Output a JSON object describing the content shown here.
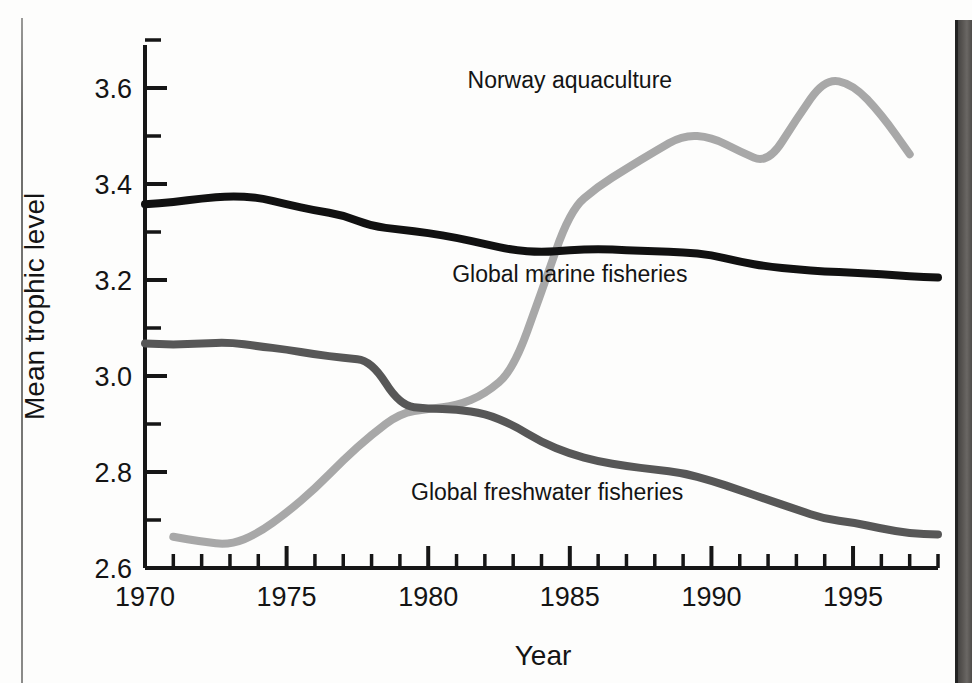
{
  "chart_data": {
    "type": "line",
    "title": "",
    "xlabel": "Year",
    "ylabel": "Mean trophic level",
    "xlim": [
      1970,
      1998
    ],
    "ylim": [
      2.6,
      3.7
    ],
    "x_ticks": [
      1970,
      1975,
      1980,
      1985,
      1990,
      1995
    ],
    "x_tick_labels": [
      "1970",
      "1975",
      "1980",
      "1985",
      "1990",
      "1995"
    ],
    "x_minor_step": 1,
    "y_ticks": [
      2.6,
      2.8,
      3.0,
      3.2,
      3.4,
      3.6
    ],
    "y_tick_labels": [
      "2.6",
      "2.8",
      "3.0",
      "3.2",
      "3.4",
      "3.6"
    ],
    "y_minor_step": 0.1,
    "grid": false,
    "legend": "inline-annotations",
    "series": [
      {
        "name": "Norway aquaculture",
        "color": "#a8a8a8",
        "label_x": 1985.0,
        "label_y": 3.6,
        "x": [
          1971,
          1972,
          1973,
          1974,
          1975,
          1976,
          1977,
          1978,
          1979,
          1980,
          1981,
          1982,
          1983,
          1984,
          1985,
          1986,
          1987,
          1988,
          1989,
          1990,
          1991,
          1992,
          1993,
          1994,
          1995,
          1996,
          1997
        ],
        "y": [
          2.665,
          2.655,
          2.648,
          2.672,
          2.715,
          2.765,
          2.825,
          2.878,
          2.922,
          2.932,
          2.938,
          2.962,
          3.012,
          3.175,
          3.345,
          3.395,
          3.432,
          3.468,
          3.502,
          3.498,
          3.468,
          3.442,
          3.535,
          3.62,
          3.608,
          3.545,
          3.462
        ]
      },
      {
        "name": "Global marine fisheries",
        "color": "#111111",
        "label_x": 1985.0,
        "label_y": 3.195,
        "x": [
          1970,
          1971,
          1972,
          1973,
          1974,
          1975,
          1976,
          1977,
          1978,
          1979,
          1980,
          1981,
          1982,
          1983,
          1984,
          1985,
          1986,
          1987,
          1988,
          1989,
          1990,
          1991,
          1992,
          1993,
          1994,
          1995,
          1996,
          1997,
          1998
        ],
        "y": [
          3.358,
          3.362,
          3.37,
          3.375,
          3.372,
          3.358,
          3.345,
          3.335,
          3.312,
          3.305,
          3.298,
          3.288,
          3.275,
          3.262,
          3.258,
          3.262,
          3.265,
          3.262,
          3.26,
          3.258,
          3.252,
          3.238,
          3.228,
          3.222,
          3.218,
          3.215,
          3.212,
          3.208,
          3.205
        ]
      },
      {
        "name": "Global freshwater fisheries",
        "color": "#575757",
        "label_x": 1984.2,
        "label_y": 2.742,
        "x": [
          1970,
          1971,
          1972,
          1973,
          1974,
          1975,
          1976,
          1977,
          1978,
          1979,
          1980,
          1981,
          1982,
          1983,
          1984,
          1985,
          1986,
          1987,
          1988,
          1989,
          1990,
          1991,
          1992,
          1993,
          1994,
          1995,
          1996,
          1997,
          1998
        ],
        "y": [
          3.068,
          3.065,
          3.068,
          3.07,
          3.062,
          3.055,
          3.045,
          3.038,
          3.032,
          2.938,
          2.932,
          2.93,
          2.922,
          2.898,
          2.862,
          2.838,
          2.822,
          2.812,
          2.805,
          2.798,
          2.782,
          2.762,
          2.742,
          2.722,
          2.702,
          2.695,
          2.682,
          2.672,
          2.67
        ]
      }
    ]
  },
  "annotations": {
    "norway_label": "Norway aquaculture",
    "marine_label": "Global marine fisheries",
    "freshwater_label": "Global freshwater fisheries"
  },
  "axes": {
    "x_title": "Year",
    "y_title": "Mean trophic level"
  }
}
